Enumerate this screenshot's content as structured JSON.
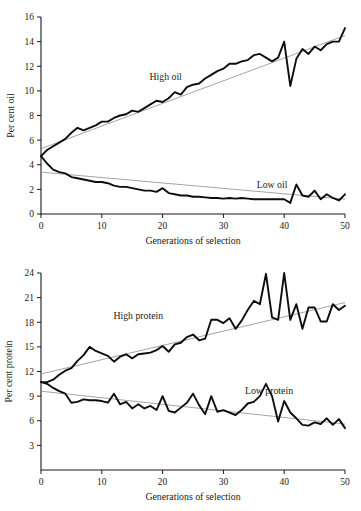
{
  "figure": {
    "name": "divergent-selection-figure",
    "panels": [
      "oil",
      "protein"
    ]
  },
  "chart_data": [
    {
      "id": "oil",
      "type": "line",
      "title": "",
      "xlabel": "Generations of selection",
      "ylabel": "Per cent oil",
      "xlim": [
        0,
        50
      ],
      "ylim": [
        0,
        16
      ],
      "xticks": [
        0,
        10,
        20,
        30,
        40,
        50
      ],
      "yticks": [
        0,
        2,
        4,
        6,
        8,
        10,
        12,
        14,
        16
      ],
      "grid": false,
      "legend_position": "inline-annotation",
      "annotations": [
        {
          "text": "High oil",
          "x": 20.5,
          "y": 10.9
        },
        {
          "text": "Low oil",
          "x": 38.0,
          "y": 2.1
        }
      ],
      "x": [
        0,
        1,
        2,
        3,
        4,
        5,
        6,
        7,
        8,
        9,
        10,
        11,
        12,
        13,
        14,
        15,
        16,
        17,
        18,
        19,
        20,
        21,
        22,
        23,
        24,
        25,
        26,
        27,
        28,
        29,
        30,
        31,
        32,
        33,
        34,
        35,
        36,
        37,
        38,
        39,
        40,
        41,
        42,
        43,
        44,
        45,
        46,
        47,
        48,
        49,
        50
      ],
      "series": [
        {
          "name": "High oil",
          "values": [
            4.7,
            5.2,
            5.5,
            5.8,
            6.1,
            6.6,
            7.0,
            6.8,
            7.0,
            7.2,
            7.5,
            7.5,
            7.8,
            8.0,
            8.1,
            8.4,
            8.3,
            8.6,
            8.9,
            9.2,
            9.1,
            9.4,
            9.9,
            9.7,
            10.3,
            10.5,
            10.6,
            11.0,
            11.3,
            11.6,
            11.8,
            12.2,
            12.2,
            12.4,
            12.5,
            12.9,
            13.0,
            12.7,
            12.4,
            12.7,
            14.0,
            10.4,
            12.6,
            13.4,
            13.0,
            13.6,
            13.3,
            13.8,
            14.0,
            14.0,
            15.1
          ],
          "trend": {
            "type": "linear",
            "start_value": 5.3,
            "end_value": 14.5
          }
        },
        {
          "name": "Low oil",
          "values": [
            4.7,
            4.1,
            3.6,
            3.4,
            3.3,
            3.0,
            2.9,
            2.8,
            2.7,
            2.6,
            2.6,
            2.5,
            2.3,
            2.2,
            2.2,
            2.1,
            2.0,
            1.9,
            1.9,
            1.8,
            2.1,
            1.7,
            1.6,
            1.5,
            1.5,
            1.4,
            1.4,
            1.35,
            1.3,
            1.3,
            1.25,
            1.3,
            1.25,
            1.3,
            1.25,
            1.2,
            1.2,
            1.2,
            1.2,
            1.2,
            1.2,
            0.9,
            2.4,
            1.5,
            1.4,
            1.9,
            1.2,
            1.6,
            1.3,
            1.1,
            1.6
          ],
          "trend": {
            "type": "linear",
            "start_value": 3.4,
            "end_value": 1.2
          }
        }
      ]
    },
    {
      "id": "protein",
      "type": "line",
      "title": "",
      "xlabel": "Generations of selection",
      "ylabel": "Per cent protein",
      "xlim": [
        0,
        50
      ],
      "ylim": [
        0,
        24
      ],
      "xticks": [
        0,
        10,
        20,
        30,
        40,
        50
      ],
      "yticks": [
        3,
        6,
        9,
        12,
        15,
        18,
        21,
        24
      ],
      "grid": false,
      "legend_position": "inline-annotation",
      "annotations": [
        {
          "text": "High protein",
          "x": 16.0,
          "y": 18.4
        },
        {
          "text": "Low protein",
          "x": 37.5,
          "y": 9.2
        }
      ],
      "x": [
        0,
        1,
        2,
        3,
        4,
        5,
        6,
        7,
        8,
        9,
        10,
        11,
        12,
        13,
        14,
        15,
        16,
        17,
        18,
        19,
        20,
        21,
        22,
        23,
        24,
        25,
        26,
        27,
        28,
        29,
        30,
        31,
        32,
        33,
        34,
        35,
        36,
        37,
        38,
        39,
        40,
        41,
        42,
        43,
        44,
        45,
        46,
        47,
        48,
        49,
        50
      ],
      "series": [
        {
          "name": "High protein",
          "values": [
            10.7,
            10.7,
            11.0,
            11.6,
            12.1,
            12.4,
            13.3,
            14.0,
            15.0,
            14.5,
            14.2,
            13.9,
            13.2,
            13.8,
            14.1,
            13.6,
            14.1,
            14.2,
            14.3,
            14.6,
            15.1,
            14.4,
            15.3,
            15.5,
            16.2,
            16.5,
            15.8,
            16.0,
            18.3,
            18.3,
            17.9,
            18.5,
            17.2,
            18.2,
            19.5,
            20.6,
            20.2,
            23.9,
            18.6,
            18.3,
            24.0,
            18.3,
            20.2,
            17.2,
            19.8,
            19.8,
            18.1,
            18.1,
            20.2,
            19.5,
            20.0
          ],
          "trend": {
            "type": "linear",
            "start_value": 11.7,
            "end_value": 20.4
          }
        },
        {
          "name": "Low protein",
          "values": [
            10.7,
            10.5,
            10.0,
            9.6,
            9.3,
            8.2,
            8.3,
            8.6,
            8.5,
            8.5,
            8.4,
            8.2,
            9.3,
            8.0,
            8.3,
            7.5,
            8.0,
            7.5,
            7.8,
            7.3,
            9.0,
            7.2,
            7.0,
            7.6,
            8.2,
            9.3,
            7.9,
            6.8,
            9.0,
            7.1,
            7.3,
            7.0,
            6.7,
            7.3,
            8.1,
            8.3,
            9.0,
            10.5,
            9.0,
            5.9,
            8.4,
            7.0,
            6.3,
            5.5,
            5.4,
            5.8,
            5.6,
            6.3,
            5.5,
            6.2,
            5.1
          ],
          "trend": {
            "type": "linear",
            "start_value": 9.6,
            "end_value": 5.6
          }
        }
      ]
    }
  ],
  "colors": {
    "data_line": "#0d0d0d",
    "trend_line": "#8d8d8d",
    "axis": "#1a1a1a",
    "background": "#ffffff"
  }
}
